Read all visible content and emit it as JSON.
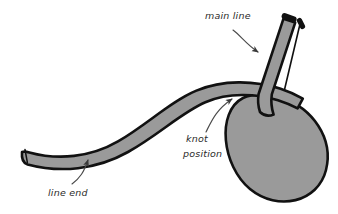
{
  "figure": {
    "kind": "knot-illustration",
    "background_color": "#ffffff",
    "rope": {
      "fill_color": "#9a9a9a",
      "outline_color": "#111111",
      "tip_color": "#111111",
      "width_px": 13
    }
  },
  "labels": {
    "main_line": {
      "text": "main line",
      "x": 205,
      "y": 19
    },
    "knot_position": {
      "line1": "knot",
      "line2": "position",
      "x": 186,
      "y": 142
    },
    "line_end": {
      "text": "line end",
      "x": 48,
      "y": 196
    }
  },
  "annotations": {
    "main_line_arrow": "curved-leader-arrow-down-right",
    "knot_position_arrow": "curved-leader-arrow-up-right",
    "line_end_arrow": "curved-leader-arrow-up"
  },
  "colors": {
    "rope_fill": "#9a9a9a",
    "rope_outline": "#111111",
    "text": "#2b2b2b",
    "leader": "#4a4a4a"
  }
}
